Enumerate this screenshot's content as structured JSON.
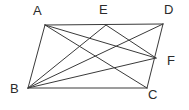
{
  "figure": {
    "background_color": "#ffffff",
    "line_color": "#3a3a3a",
    "label_color": "#2b2b2b",
    "width": 189,
    "height": 110,
    "vertices": [
      {
        "id": "A",
        "label": "A",
        "x": 45,
        "y": 25
      },
      {
        "id": "E",
        "label": "E",
        "x": 106,
        "y": 25
      },
      {
        "id": "D",
        "label": "D",
        "x": 163,
        "y": 24
      },
      {
        "id": "F",
        "label": "F",
        "x": 156,
        "y": 58
      },
      {
        "id": "C",
        "label": "C",
        "x": 147,
        "y": 88
      },
      {
        "id": "B",
        "label": "B",
        "x": 28,
        "y": 88
      }
    ],
    "edges": [
      {
        "name": "edge-AD",
        "from": "A",
        "to": "D"
      },
      {
        "name": "edge-DC",
        "from": "D",
        "to": "C"
      },
      {
        "name": "edge-CB",
        "from": "C",
        "to": "B"
      },
      {
        "name": "edge-BA",
        "from": "B",
        "to": "A"
      }
    ],
    "diagonals": [
      {
        "name": "segment-AC",
        "from": "A",
        "to": "C"
      },
      {
        "name": "segment-AF",
        "from": "A",
        "to": "F"
      },
      {
        "name": "segment-BD",
        "from": "B",
        "to": "D"
      },
      {
        "name": "segment-BF",
        "from": "B",
        "to": "F"
      },
      {
        "name": "segment-BE",
        "from": "B",
        "to": "E"
      },
      {
        "name": "segment-EF",
        "from": "E",
        "to": "F"
      }
    ]
  }
}
